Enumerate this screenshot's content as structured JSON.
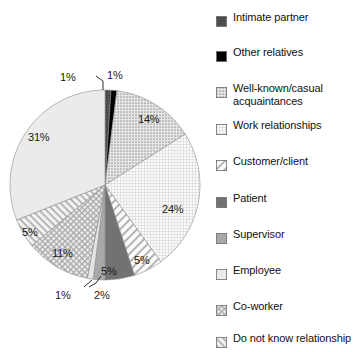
{
  "chart_data": {
    "type": "pie",
    "title": "",
    "subtitle": "",
    "xlabel": "",
    "ylabel": "",
    "legend_position": "right",
    "grid": false,
    "units": "percent",
    "categories": [
      "Intimate partner",
      "Other relatives",
      "Well-known/casual acquaintances",
      "Work relationships",
      "Customer/client",
      "Patient",
      "Supervisor",
      "Employee",
      "Co-worker",
      "Do not know relationship"
    ],
    "values": [
      1,
      1,
      14,
      24,
      5,
      5,
      2,
      31,
      11,
      5
    ],
    "slices": [
      {
        "name": "Intimate partner",
        "value": 1,
        "label": "1%",
        "fill": "dark-gray-textured",
        "color": "#4a4a4a",
        "start_deg": 0,
        "end_deg": 3.6,
        "label_x": 60,
        "label_y": 71,
        "leader": true
      },
      {
        "name": "Other relatives",
        "value": 1,
        "label": "1%",
        "fill": "solid-black",
        "color": "#000000",
        "start_deg": 3.6,
        "end_deg": 7.2,
        "label_x": 107,
        "label_y": 69,
        "leader": false
      },
      {
        "name": "Well-known/casual acquaintances",
        "value": 14,
        "label": "14%",
        "fill": "dotted-gray",
        "color": "#d2d2d2",
        "start_deg": 7.2,
        "end_deg": 57.6,
        "label_x": 138,
        "label_y": 113,
        "leader": false
      },
      {
        "name": "Work relationships",
        "value": 24,
        "label": "24%",
        "fill": "fine-grid",
        "color": "#f0f0f0",
        "start_deg": 57.6,
        "end_deg": 144.0,
        "label_x": 162,
        "label_y": 203,
        "leader": false
      },
      {
        "name": "Customer/client",
        "value": 5,
        "label": "5%",
        "fill": "diagonal-hatch",
        "color": "#e8e8e8",
        "start_deg": 144.0,
        "end_deg": 162.0,
        "label_x": 134,
        "label_y": 254,
        "leader": false
      },
      {
        "name": "Patient",
        "value": 5,
        "label": "5%",
        "fill": "solid-dark-gray",
        "color": "#727272",
        "start_deg": 162.0,
        "end_deg": 180.0,
        "label_x": 101,
        "label_y": 265,
        "leader": false
      },
      {
        "name": "Supervisor",
        "value": 2,
        "label": "2%",
        "fill": "solid-medium-gray",
        "color": "#a8a8a8",
        "start_deg": 180.0,
        "end_deg": 187.2,
        "label_x": 94,
        "label_y": 289,
        "leader": true
      },
      {
        "name": "unlabeled-thin-slice",
        "value": 1,
        "label": "1%",
        "fill": "very-light-gray",
        "color": "#e4e4e4",
        "start_deg": 187.2,
        "end_deg": 190.8,
        "label_x": 55,
        "label_y": 289,
        "leader": true
      },
      {
        "name": "Co-worker",
        "value": 11,
        "label": "11%",
        "fill": "checkered",
        "color": "#dcdcdc",
        "start_deg": 190.8,
        "end_deg": 230.4,
        "label_x": 52,
        "label_y": 247,
        "leader": false
      },
      {
        "name": "Do not know relationship",
        "value": 5,
        "label": "5%",
        "fill": "diagonal-hatch-coarse",
        "color": "#dedede",
        "start_deg": 230.4,
        "end_deg": 248.4,
        "label_x": 22,
        "label_y": 226,
        "leader": false
      },
      {
        "name": "Employee",
        "value": 31,
        "label": "31%",
        "fill": "light-gray-solid",
        "color": "#ebebeb",
        "start_deg": 248.4,
        "end_deg": 360.0,
        "label_x": 28,
        "label_y": 131,
        "leader": false
      }
    ]
  },
  "legend": {
    "items": [
      {
        "label": "Intimate partner",
        "swatch": "dark-gray-textured",
        "color": "#4a4a4a",
        "top": 11
      },
      {
        "label": "Other relatives",
        "swatch": "solid-black",
        "color": "#000000",
        "top": 46
      },
      {
        "label": "Well-known/casual acquaintances",
        "swatch": "dotted-gray",
        "color": "#d2d2d2",
        "top": 82
      },
      {
        "label": "Work relationships",
        "swatch": "fine-grid",
        "color": "#f0f0f0",
        "top": 119
      },
      {
        "label": "Customer/client",
        "swatch": "diagonal-hatch",
        "color": "#e8e8e8",
        "top": 155
      },
      {
        "label": "Patient",
        "swatch": "solid-dark-gray",
        "color": "#727272",
        "top": 192
      },
      {
        "label": "Supervisor",
        "swatch": "solid-medium-gray",
        "color": "#a8a8a8",
        "top": 228
      },
      {
        "label": "Employee",
        "swatch": "light-gray-solid",
        "color": "#c8c8c8",
        "top": 264
      },
      {
        "label": "Co-worker",
        "swatch": "checkered",
        "color": "#dcdcdc",
        "top": 300
      },
      {
        "label": "Do not know relationship",
        "swatch": "diagonal-hatch-coarse",
        "color": "#dedede",
        "top": 332
      }
    ]
  }
}
